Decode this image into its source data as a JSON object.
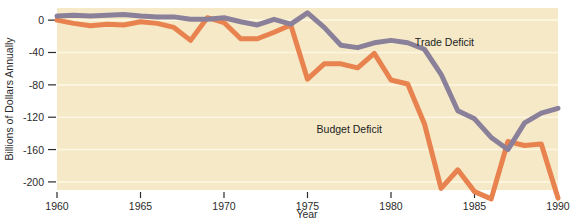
{
  "chart_data": {
    "type": "line",
    "title": "",
    "xlabel": "Year",
    "ylabel": "Billions of Dollars Annually",
    "xlim": [
      1960,
      1990
    ],
    "ylim": [
      -210,
      15
    ],
    "grid": true,
    "grid_axis": "y",
    "legend_position": "inline-annotation",
    "xticks": [
      1960,
      1965,
      1970,
      1975,
      1980,
      1985,
      1990
    ],
    "xticklabels": [
      "1960",
      "1965",
      "1970",
      "1975",
      "1980",
      "1985",
      "1990"
    ],
    "yticks": [
      0,
      -40,
      -80,
      -120,
      -160,
      -200
    ],
    "yticklabels": [
      "0",
      "-40",
      "-80",
      "-120",
      "-160",
      "-200"
    ],
    "x": [
      1960,
      1961,
      1962,
      1963,
      1964,
      1965,
      1966,
      1967,
      1968,
      1969,
      1970,
      1971,
      1972,
      1973,
      1974,
      1975,
      1976,
      1977,
      1978,
      1979,
      1980,
      1981,
      1982,
      1983,
      1984,
      1985,
      1986,
      1987,
      1988,
      1989,
      1990
    ],
    "series": [
      {
        "name": "Budget Deficit",
        "color": "#e8834f",
        "values": [
          0,
          -4,
          -7,
          -5,
          -6,
          -2,
          -4,
          -9,
          -25,
          3,
          -3,
          -23,
          -23,
          -15,
          -6,
          -73,
          -54,
          -54,
          -59,
          -41,
          -74,
          -79,
          -128,
          -208,
          -185,
          -212,
          -221,
          -150,
          -155,
          -153,
          -220
        ]
      },
      {
        "name": "Trade Deficit",
        "color": "#8a8099",
        "values": [
          5,
          6,
          5,
          6,
          7,
          5,
          4,
          4,
          1,
          1,
          3,
          -2,
          -6,
          1,
          -5,
          9,
          -9,
          -31,
          -34,
          -28,
          -25,
          -28,
          -36,
          -67,
          -112,
          -122,
          -145,
          -160,
          -127,
          -115,
          -109
        ]
      }
    ],
    "annotations": [
      {
        "text": "Trade Deficit",
        "x": 1983.2,
        "y": -32
      },
      {
        "text": "Budget Deficit",
        "x": 1977.5,
        "y": -139
      }
    ]
  },
  "style": {
    "plot_background": "#f5e9c8",
    "page_background": "#ffffff",
    "gridline_color": "#fdf6e0",
    "text_color": "#2b2b2b"
  }
}
